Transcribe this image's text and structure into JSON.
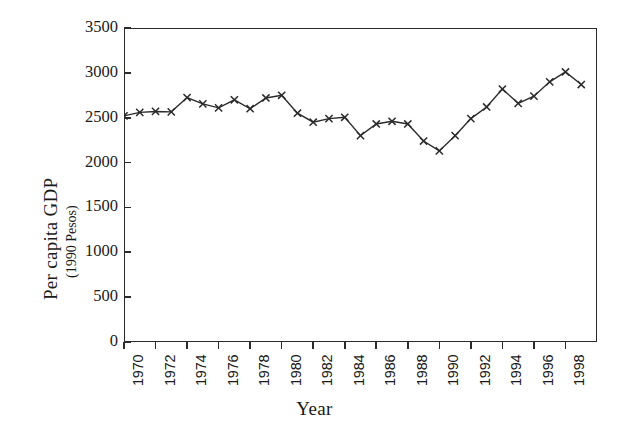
{
  "chart_data": {
    "type": "line",
    "title": "",
    "xlabel": "Year",
    "ylabel": "Per capita GDP",
    "ylabel_sub": "(1990 Pesos)",
    "ylim": [
      0,
      3500
    ],
    "xlim": [
      1970,
      2000
    ],
    "grid": false,
    "legend": null,
    "marker": "x",
    "line_color": "#2b2b2b",
    "ytick_labels": [
      "3500",
      "3000",
      "2500",
      "2000",
      "1500",
      "1000",
      "500",
      "0"
    ],
    "ytick_values": [
      3500,
      3000,
      2500,
      2000,
      1500,
      1000,
      500,
      0
    ],
    "xtick_labels": [
      "1970",
      "1972",
      "1974",
      "1976",
      "1978",
      "1980",
      "1982",
      "1984",
      "1986",
      "1988",
      "1990",
      "1992",
      "1994",
      "1996",
      "1998"
    ],
    "xtick_values": [
      1970,
      1972,
      1974,
      1976,
      1978,
      1980,
      1982,
      1984,
      1986,
      1988,
      1990,
      1992,
      1994,
      1996,
      1998
    ],
    "x": [
      1970,
      1971,
      1972,
      1973,
      1974,
      1975,
      1976,
      1977,
      1978,
      1979,
      1980,
      1981,
      1982,
      1983,
      1984,
      1985,
      1986,
      1987,
      1988,
      1989,
      1990,
      1991,
      1992,
      1993,
      1994,
      1995,
      1996,
      1997,
      1998,
      1999
    ],
    "values": [
      2520,
      2560,
      2570,
      2565,
      2725,
      2655,
      2610,
      2700,
      2600,
      2720,
      2750,
      2550,
      2450,
      2490,
      2505,
      2300,
      2430,
      2460,
      2430,
      2240,
      2130,
      2300,
      2490,
      2620,
      2820,
      2660,
      2740,
      2900,
      3010,
      2870
    ],
    "units": "1990 Pesos"
  }
}
